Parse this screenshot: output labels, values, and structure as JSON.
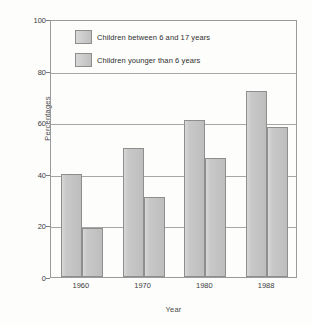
{
  "chart_data": {
    "type": "bar",
    "title": "",
    "xlabel": "Year",
    "ylabel": "Percentages",
    "categories": [
      "1960",
      "1970",
      "1980",
      "1988"
    ],
    "series": [
      {
        "name": "Children between 6 and 17 years",
        "values": [
          40,
          50,
          61,
          72
        ]
      },
      {
        "name": "Children younger than 6 years",
        "values": [
          19,
          31,
          46,
          58
        ]
      }
    ],
    "ylim": [
      0,
      100
    ],
    "yticks": [
      0,
      20,
      40,
      60,
      80,
      100
    ],
    "ytick_labels": [
      "0",
      "20",
      "40",
      "60",
      "80",
      "100"
    ],
    "grid": true,
    "legend_position": "upper-left-inside",
    "colors": {
      "bar_fill": "#c7c7c7",
      "bar_edge": "#8e8e8e",
      "grid": "#a6a6a6",
      "frame": "#9a9a9a",
      "text": "#2e2e2e",
      "background": "#fdfdfc"
    }
  }
}
